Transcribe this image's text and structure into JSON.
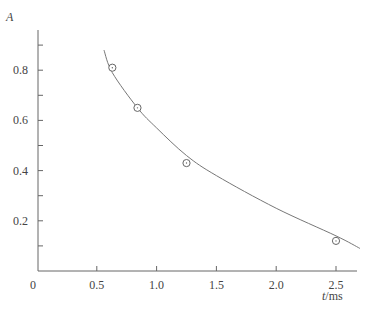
{
  "chart_data": {
    "type": "scatter",
    "title": "",
    "xlabel": "t/ms",
    "xlabel_var": "t",
    "xlabel_unit": "/ms",
    "ylabel": "A",
    "xlim": [
      0,
      2.7
    ],
    "ylim": [
      0,
      0.95
    ],
    "grid": false,
    "legend": null,
    "origin_label": "0",
    "x_ticks": [
      0.5,
      1.0,
      1.5,
      2.0,
      2.5
    ],
    "x_tick_labels": [
      "0.5",
      "1.0",
      "1.5",
      "2.0",
      "2.5"
    ],
    "y_ticks_major": [
      0.2,
      0.4,
      0.6,
      0.8
    ],
    "y_tick_labels": [
      "0.2",
      "0.4",
      "0.6",
      "0.8"
    ],
    "y_ticks_minor": [
      0.1,
      0.3,
      0.5,
      0.7,
      0.9
    ],
    "series": [
      {
        "name": "measured points",
        "type": "scatter",
        "marker": "circle-dot",
        "x": [
          0.63,
          0.84,
          1.25,
          2.5
        ],
        "y": [
          0.81,
          0.65,
          0.43,
          0.12
        ]
      },
      {
        "name": "fitted curve",
        "type": "line",
        "x": [
          0.56,
          0.63,
          0.84,
          1.0,
          1.25,
          1.5,
          2.0,
          2.5,
          2.7
        ],
        "y": [
          0.88,
          0.79,
          0.65,
          0.57,
          0.46,
          0.38,
          0.25,
          0.14,
          0.09
        ]
      }
    ]
  }
}
